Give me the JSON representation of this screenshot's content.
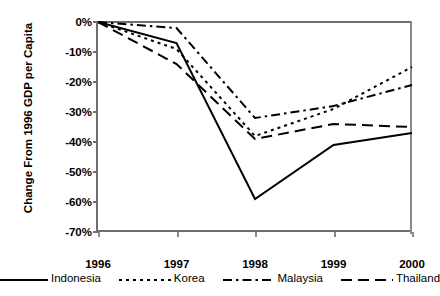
{
  "chart_data": {
    "type": "line",
    "title": "",
    "xlabel": "",
    "ylabel": "Change From 1996 GDP per Capita",
    "categories": [
      "1996",
      "1997",
      "1998",
      "1999",
      "2000"
    ],
    "x_tick_labels": [
      "1996",
      "1997",
      "1998",
      "1999",
      "2000"
    ],
    "y_tick_labels": [
      "0%",
      "-10%",
      "-20%",
      "-30%",
      "-40%",
      "-50%",
      "-60%",
      "-70%"
    ],
    "y_tick_values": [
      0,
      -10,
      -20,
      -30,
      -40,
      -50,
      -60,
      -70
    ],
    "ylim": [
      -70,
      0
    ],
    "grid": false,
    "legend_position": "bottom",
    "series": [
      {
        "name": "Indonesia",
        "style": "solid",
        "color": "#000000",
        "values": [
          0,
          -7,
          -59,
          -41,
          -37
        ]
      },
      {
        "name": "Korea",
        "style": "dotted",
        "color": "#000000",
        "values": [
          0,
          -9,
          -38,
          -29,
          -15
        ]
      },
      {
        "name": "Malaysia",
        "style": "dash-dot",
        "color": "#000000",
        "values": [
          0,
          -2,
          -32,
          -28,
          -21
        ]
      },
      {
        "name": "Thailand",
        "style": "long-dash",
        "color": "#000000",
        "values": [
          0,
          -14,
          -39,
          -34,
          -35
        ]
      }
    ]
  },
  "legend": {
    "items": [
      {
        "label": "Indonesia",
        "style": "solid"
      },
      {
        "label": "Korea",
        "style": "dotted"
      },
      {
        "label": "Malaysia",
        "style": "dash-dot"
      },
      {
        "label": "Thailand",
        "style": "long-dash"
      }
    ]
  },
  "axis": {
    "y_title": "Change From 1996 GDP per Capita"
  },
  "colors": {
    "line": "#000000",
    "axis": "#6e6e6e",
    "background": "#ffffff"
  }
}
